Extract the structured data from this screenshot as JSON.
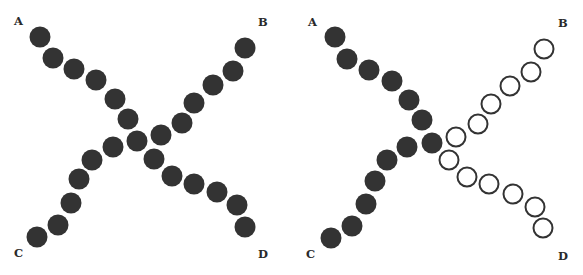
{
  "colors": {
    "filled": "#333333",
    "stroke": "#333333",
    "hollow_fill": "#ffffff",
    "background": "#ffffff"
  },
  "circle_radius": 10.5,
  "panels": [
    {
      "name": "left-panel",
      "offset_x": 0,
      "labels": [
        {
          "text": "A",
          "x": 14,
          "y": 25
        },
        {
          "text": "B",
          "x": 258,
          "y": 26
        },
        {
          "text": "C",
          "x": 14,
          "y": 257
        },
        {
          "text": "D",
          "x": 258,
          "y": 258
        }
      ],
      "paths": [
        {
          "name": "path-A-D",
          "style": "filled",
          "points": [
            [
              40,
              37
            ],
            [
              53,
              58
            ],
            [
              74,
              69
            ],
            [
              96,
              80
            ],
            [
              115,
              99
            ],
            [
              128,
              119
            ],
            [
              137,
              141
            ],
            [
              154,
              159
            ],
            [
              172,
              176
            ],
            [
              194,
              184
            ],
            [
              217,
              192
            ],
            [
              237,
              205
            ],
            [
              245,
              227
            ]
          ]
        },
        {
          "name": "path-B-C",
          "style": "filled",
          "points": [
            [
              245,
              48
            ],
            [
              233,
              71
            ],
            [
              213,
              85
            ],
            [
              194,
              103
            ],
            [
              182,
              123
            ],
            [
              161,
              135
            ],
            [
              113,
              147
            ],
            [
              92,
              160
            ],
            [
              79,
              179
            ],
            [
              71,
              203
            ],
            [
              58,
              225
            ],
            [
              37,
              237
            ]
          ]
        }
      ]
    },
    {
      "name": "right-panel",
      "offset_x": 290,
      "labels": [
        {
          "text": "A",
          "x": 18,
          "y": 26
        },
        {
          "text": "B",
          "x": 268,
          "y": 27
        },
        {
          "text": "C",
          "x": 16,
          "y": 258
        },
        {
          "text": "D",
          "x": 268,
          "y": 260
        }
      ],
      "paths": [
        {
          "name": "path-A",
          "style": "filled",
          "points": [
            [
              45,
              37
            ],
            [
              57,
              59
            ],
            [
              79,
              70
            ],
            [
              102,
              81
            ],
            [
              119,
              100
            ],
            [
              132,
              120
            ],
            [
              142,
              143
            ]
          ]
        },
        {
          "name": "path-C",
          "style": "filled",
          "points": [
            [
              117,
              147
            ],
            [
              97,
              160
            ],
            [
              85,
              181
            ],
            [
              76,
              204
            ],
            [
              62,
              226
            ],
            [
              41,
              238
            ]
          ]
        },
        {
          "name": "path-B",
          "style": "hollow",
          "points": [
            [
              254,
              49
            ],
            [
              241,
              72
            ],
            [
              220,
              86
            ],
            [
              201,
              104
            ],
            [
              188,
              124
            ],
            [
              166,
              137
            ]
          ]
        },
        {
          "name": "path-D",
          "style": "hollow",
          "points": [
            [
              159,
              160
            ],
            [
              177,
              177
            ],
            [
              199,
              184
            ],
            [
              223,
              194
            ],
            [
              245,
              207
            ],
            [
              253,
              228
            ]
          ]
        }
      ]
    }
  ]
}
